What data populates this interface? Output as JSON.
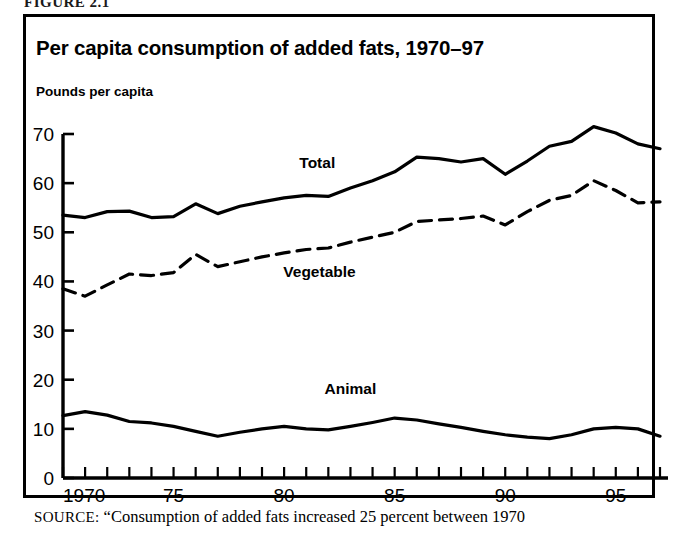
{
  "figure": {
    "label": "FIGURE 2.1"
  },
  "chart": {
    "title": "Per capita consumption of added fats, 1970–97",
    "unit_label": "Pounds per capita"
  },
  "source": {
    "kicker": "SOURCE:",
    "text": "“Consumption of added fats increased 25 percent between 1970"
  },
  "chart_data": {
    "type": "line",
    "title": "Per capita consumption of added fats, 1970–97",
    "xlabel": "",
    "ylabel": "Pounds per capita",
    "xlim": [
      1970,
      1997
    ],
    "ylim": [
      0,
      70
    ],
    "ytick_values": [
      0,
      10,
      20,
      30,
      40,
      50,
      60,
      70
    ],
    "ytick_labels": [
      "0",
      "10",
      "20",
      "30",
      "40",
      "50",
      "60",
      "70"
    ],
    "xtick_values": [
      1970,
      1971,
      1972,
      1973,
      1974,
      1975,
      1976,
      1977,
      1978,
      1979,
      1980,
      1981,
      1982,
      1983,
      1984,
      1985,
      1986,
      1987,
      1988,
      1989,
      1990,
      1991,
      1992,
      1993,
      1994,
      1995,
      1996,
      1997
    ],
    "xtick_labeled": [
      {
        "value": 1970,
        "label": "1970"
      },
      {
        "value": 1975,
        "label": "75"
      },
      {
        "value": 1980,
        "label": "80"
      },
      {
        "value": 1985,
        "label": "85"
      },
      {
        "value": 1990,
        "label": "90"
      },
      {
        "value": 1995,
        "label": "95"
      }
    ],
    "grid": false,
    "legend_position": "inline-annotations",
    "x": [
      1970,
      1971,
      1972,
      1973,
      1974,
      1975,
      1976,
      1977,
      1978,
      1979,
      1980,
      1981,
      1982,
      1983,
      1984,
      1985,
      1986,
      1987,
      1988,
      1989,
      1990,
      1991,
      1992,
      1993,
      1994,
      1995,
      1996,
      1997
    ],
    "series": [
      {
        "name": "Total",
        "style": "solid",
        "label_text": "Total",
        "values": [
          53.5,
          53.0,
          54.2,
          54.3,
          53.0,
          53.2,
          55.8,
          53.8,
          55.3,
          56.2,
          57.0,
          57.5,
          57.3,
          59.0,
          60.5,
          62.3,
          65.3,
          65.0,
          64.3,
          65.0,
          61.8,
          64.5,
          67.5,
          68.5,
          71.5,
          70.2,
          68.0,
          67.0
        ]
      },
      {
        "name": "Vegetable",
        "style": "dashed",
        "label_text": "Vegetable",
        "values": [
          38.5,
          37.0,
          39.3,
          41.5,
          41.2,
          41.8,
          45.5,
          43.0,
          44.0,
          45.0,
          45.8,
          46.5,
          46.8,
          48.0,
          49.0,
          50.0,
          52.2,
          52.5,
          52.8,
          53.3,
          51.5,
          54.2,
          56.5,
          57.5,
          60.5,
          58.5,
          56.0,
          56.2
        ]
      },
      {
        "name": "Animal",
        "style": "solid",
        "label_text": "Animal",
        "values": [
          12.7,
          13.5,
          12.8,
          11.5,
          11.2,
          10.5,
          9.5,
          8.5,
          9.3,
          10.0,
          10.5,
          10.0,
          9.8,
          10.5,
          11.3,
          12.2,
          11.8,
          11.0,
          10.3,
          9.5,
          8.8,
          8.3,
          8.0,
          8.8,
          10.0,
          10.3,
          10.0,
          8.5
        ]
      }
    ],
    "annotations": [
      {
        "text": "Total",
        "x": 1981.5,
        "y": 63.0
      },
      {
        "text": "Vegetable",
        "x": 1981.6,
        "y": 40.8
      },
      {
        "text": "Animal",
        "x": 1983.0,
        "y": 17.0
      }
    ]
  }
}
